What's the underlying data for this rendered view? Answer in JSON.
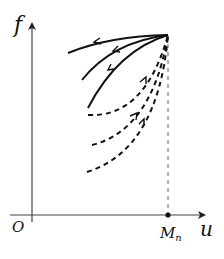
{
  "diagram": {
    "labels": {
      "y_axis": "f",
      "x_axis": "u",
      "origin": "O",
      "point_main": "M",
      "point_sub": "n"
    },
    "colors": {
      "ink": "#111111",
      "axis": "#444444",
      "guide": "#666666",
      "background": "#ffffff"
    },
    "curves": {
      "solid_count": 3,
      "dashed_count": 3,
      "solid_direction": "toward left (away from convergence point)",
      "dashed_direction": "toward convergence point (upper right)"
    }
  }
}
